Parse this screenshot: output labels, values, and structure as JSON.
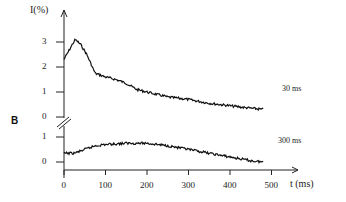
{
  "chart_data": {
    "type": "line",
    "title": "",
    "panel_label": "B",
    "xlabel": "t (ms)",
    "ylabel": "I(%)",
    "xlim": [
      0,
      500
    ],
    "x_ticks": [
      0,
      100,
      200,
      300,
      400,
      500
    ],
    "grid": false,
    "axis_break": true,
    "series": [
      {
        "name": "30 ms",
        "y_ticks": [
          0,
          1,
          2,
          3
        ],
        "x": [
          0,
          10,
          20,
          27,
          40,
          55,
          75,
          100,
          125,
          150,
          175,
          200,
          250,
          300,
          350,
          400,
          450,
          480
        ],
        "values": [
          2.3,
          2.6,
          2.9,
          3.1,
          2.9,
          2.5,
          1.75,
          1.6,
          1.5,
          1.35,
          1.1,
          1.0,
          0.8,
          0.7,
          0.55,
          0.45,
          0.35,
          0.3
        ]
      },
      {
        "name": "300 ms",
        "y_ticks": [
          0,
          1
        ],
        "x": [
          0,
          25,
          50,
          75,
          100,
          150,
          200,
          250,
          300,
          350,
          400,
          450,
          480
        ],
        "values": [
          0.35,
          0.35,
          0.5,
          0.65,
          0.7,
          0.75,
          0.75,
          0.65,
          0.5,
          0.35,
          0.2,
          0.05,
          0.0
        ]
      }
    ]
  }
}
